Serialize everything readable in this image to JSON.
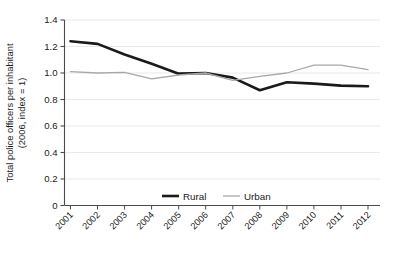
{
  "chart_data": {
    "type": "line",
    "title": "",
    "xlabel": "",
    "ylabel": "Total police officers per inhabitant",
    "ylabel_line2": "(2006, index = 1)",
    "categories": [
      "2001",
      "2002",
      "2003",
      "2004",
      "2005",
      "2006",
      "2007",
      "2008",
      "2009",
      "2010",
      "2011",
      "2012"
    ],
    "x": [
      2001,
      2002,
      2003,
      2004,
      2005,
      2006,
      2007,
      2008,
      2009,
      2010,
      2011,
      2012
    ],
    "series": [
      {
        "name": "Rural",
        "color": "#1a1a1a",
        "width": 2.6,
        "values": [
          1.24,
          1.22,
          1.14,
          1.07,
          0.995,
          1.0,
          0.965,
          0.87,
          0.93,
          0.92,
          0.905,
          0.9
        ]
      },
      {
        "name": "Urban",
        "color": "#a8a8a8",
        "width": 1.3,
        "values": [
          1.01,
          1.0,
          1.005,
          0.955,
          0.985,
          1.0,
          0.945,
          0.975,
          1.0,
          1.06,
          1.06,
          1.025
        ]
      }
    ],
    "ylim": [
      0,
      1.4
    ],
    "yticks": [
      "0",
      "0.2",
      "0.4",
      "0.6",
      "0.8",
      "1.0",
      "1.2",
      "1.4"
    ],
    "ytick_values": [
      0,
      0.2,
      0.4,
      0.6,
      0.8,
      1.0,
      1.2,
      1.4
    ],
    "grid": true,
    "grid_axis": "y",
    "grid_color": "#e6e6e6",
    "legend_position": "inside-bottom-center",
    "legend_entries": [
      {
        "label": "Rural",
        "color": "#1a1a1a"
      },
      {
        "label": "Urban",
        "color": "#a8a8a8"
      }
    ],
    "axis_color": "#4a4a4a",
    "background": "#ffffff",
    "xtick_rotation": -45
  }
}
